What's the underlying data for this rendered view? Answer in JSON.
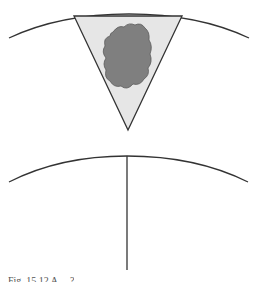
{
  "figure": {
    "caption_partial": "Fig. 15.12  A  ... ?",
    "colors": {
      "line": "#333333",
      "triangle_fill": "#e6e6e6",
      "blob_fill": "#7f7f7f",
      "blob_stroke": "#555555"
    },
    "panels": [
      {
        "name": "top-panel",
        "description": "arc with inverted triangle containing irregular gray mass"
      },
      {
        "name": "bottom-panel",
        "description": "arc with vertical line dropping from apex"
      }
    ]
  }
}
